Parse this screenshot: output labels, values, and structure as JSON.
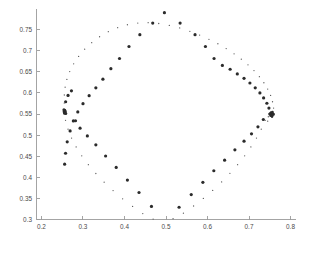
{
  "chart_data": {
    "type": "scatter",
    "title": "",
    "subtitle": "",
    "xlabel": "",
    "ylabel": "",
    "xlim": [
      0.188,
      0.812
    ],
    "ylim": [
      0.3,
      0.8
    ],
    "xticks": [
      0.2,
      0.3,
      0.4,
      0.5,
      0.6,
      0.7,
      0.8
    ],
    "xtick_labels": [
      "0.2",
      "0.3",
      "0.4",
      "0.5",
      "0.6",
      "0.7",
      "0.8"
    ],
    "yticks": [
      0.3,
      0.35,
      0.4,
      0.45,
      0.5,
      0.55,
      0.6,
      0.65,
      0.7,
      0.75
    ],
    "ytick_labels": [
      "0.3",
      "0.35",
      "0.4",
      "0.45",
      "0.5",
      "0.55",
      "0.6",
      "0.65",
      "0.7",
      "0.75"
    ],
    "grid": false,
    "legend": "none",
    "axis_color": "#9a9a9a",
    "marker_colors": {
      "inner": "#2b2b2b",
      "outer": "#5a5a5a"
    },
    "series": [
      {
        "name": "inner-curve",
        "marker": "large-dot",
        "marker_size": 3.2,
        "color": "#2b2b2b",
        "points": [
          [
            0.7502,
            0.55
          ],
          [
            0.748,
            0.564
          ],
          [
            0.743,
            0.5755
          ],
          [
            0.7352,
            0.588
          ],
          [
            0.7262,
            0.6
          ],
          [
            0.715,
            0.612
          ],
          [
            0.7022,
            0.6235
          ],
          [
            0.688,
            0.6345
          ],
          [
            0.6718,
            0.645
          ],
          [
            0.6545,
            0.656
          ],
          [
            0.6358,
            0.665
          ],
          [
            0.6158,
            0.6815
          ],
          [
            0.595,
            0.71
          ],
          [
            0.57,
            0.738
          ],
          [
            0.534,
            0.7655
          ],
          [
            0.4962,
            0.79
          ],
          [
            0.468,
            0.7655
          ],
          [
            0.437,
            0.738
          ],
          [
            0.4108,
            0.71
          ],
          [
            0.388,
            0.6815
          ],
          [
            0.3672,
            0.6575
          ],
          [
            0.348,
            0.6325
          ],
          [
            0.331,
            0.612
          ],
          [
            0.3148,
            0.5935
          ],
          [
            0.3,
            0.5745
          ],
          [
            0.2875,
            0.555
          ],
          [
            0.2768,
            0.5335
          ],
          [
            0.269,
            0.51
          ],
          [
            0.262,
            0.484
          ],
          [
            0.258,
            0.457
          ],
          [
            0.2558,
            0.431
          ],
          [
            0.2555,
            0.555
          ],
          [
            0.2582,
            0.579
          ],
          [
            0.264,
            0.594
          ],
          [
            0.2722,
            0.605
          ],
          [
            0.282,
            0.534
          ],
          [
            0.293,
            0.5165
          ],
          [
            0.3105,
            0.498
          ],
          [
            0.331,
            0.477
          ],
          [
            0.3545,
            0.4505
          ],
          [
            0.38,
            0.4235
          ],
          [
            0.407,
            0.3935
          ],
          [
            0.435,
            0.364
          ],
          [
            0.465,
            0.331
          ],
          [
            0.5315,
            0.329
          ],
          [
            0.5608,
            0.359
          ],
          [
            0.5888,
            0.388
          ],
          [
            0.6152,
            0.4155
          ],
          [
            0.6412,
            0.4405
          ],
          [
            0.666,
            0.465
          ],
          [
            0.688,
            0.4855
          ],
          [
            0.706,
            0.503
          ],
          [
            0.7215,
            0.5195
          ],
          [
            0.7345,
            0.537
          ]
        ]
      },
      {
        "name": "outer-curve",
        "marker": "small-dot",
        "marker_size": 1.3,
        "color": "#5a5a5a",
        "points": [
          [
            0.76,
            0.5505
          ],
          [
            0.7592,
            0.564
          ],
          [
            0.7566,
            0.579
          ],
          [
            0.752,
            0.594
          ],
          [
            0.745,
            0.609
          ],
          [
            0.7358,
            0.624
          ],
          [
            0.725,
            0.6385
          ],
          [
            0.712,
            0.653
          ],
          [
            0.6975,
            0.6665
          ],
          [
            0.6815,
            0.68
          ],
          [
            0.664,
            0.6925
          ],
          [
            0.645,
            0.705
          ],
          [
            0.625,
            0.7165
          ],
          [
            0.6035,
            0.727
          ],
          [
            0.581,
            0.737
          ],
          [
            0.5575,
            0.746
          ],
          [
            0.533,
            0.754
          ],
          [
            0.508,
            0.76
          ],
          [
            0.4825,
            0.7645
          ],
          [
            0.457,
            0.7665
          ],
          [
            0.432,
            0.7655
          ],
          [
            0.407,
            0.7615
          ],
          [
            0.3835,
            0.7545
          ],
          [
            0.361,
            0.745
          ],
          [
            0.34,
            0.733
          ],
          [
            0.321,
            0.719
          ],
          [
            0.304,
            0.7035
          ],
          [
            0.2895,
            0.6865
          ],
          [
            0.2775,
            0.669
          ],
          [
            0.268,
            0.6505
          ],
          [
            0.2612,
            0.632
          ],
          [
            0.257,
            0.6135
          ],
          [
            0.255,
            0.595
          ],
          [
            0.2548,
            0.576
          ],
          [
            0.2552,
            0.556
          ],
          [
            0.258,
            0.535
          ],
          [
            0.264,
            0.514
          ],
          [
            0.2725,
            0.493
          ],
          [
            0.2835,
            0.472
          ],
          [
            0.297,
            0.451
          ],
          [
            0.313,
            0.43
          ],
          [
            0.331,
            0.409
          ],
          [
            0.351,
            0.3885
          ],
          [
            0.3725,
            0.3685
          ],
          [
            0.3955,
            0.349
          ],
          [
            0.4195,
            0.331
          ],
          [
            0.444,
            0.314
          ],
          [
            0.469,
            0.301
          ],
          [
            0.517,
            0.302
          ],
          [
            0.542,
            0.315
          ],
          [
            0.5665,
            0.332
          ],
          [
            0.59,
            0.35
          ],
          [
            0.6125,
            0.369
          ],
          [
            0.634,
            0.389
          ],
          [
            0.654,
            0.4095
          ],
          [
            0.6725,
            0.43
          ],
          [
            0.6895,
            0.451
          ],
          [
            0.7045,
            0.472
          ],
          [
            0.718,
            0.493
          ],
          [
            0.7295,
            0.514
          ],
          [
            0.739,
            0.535
          ],
          [
            0.7465,
            0.5435
          ],
          [
            0.7535,
            0.547
          ],
          [
            0.7555,
            0.542
          ],
          [
            0.745,
            0.533
          ]
        ]
      },
      {
        "name": "left-cusp-cluster",
        "marker": "large-dot",
        "marker_size": 3.0,
        "color": "#2b2b2b",
        "points": [
          [
            0.2545,
            0.5555
          ],
          [
            0.2555,
            0.552
          ],
          [
            0.2562,
            0.559
          ],
          [
            0.2575,
            0.5555
          ],
          [
            0.254,
            0.56
          ],
          [
            0.2585,
            0.551
          ]
        ]
      },
      {
        "name": "right-cusp-cluster",
        "marker": "large-dot",
        "marker_size": 2.6,
        "color": "#2b2b2b",
        "points": [
          [
            0.7545,
            0.55
          ],
          [
            0.756,
            0.547
          ],
          [
            0.7575,
            0.551
          ],
          [
            0.753,
            0.5535
          ],
          [
            0.752,
            0.546
          ],
          [
            0.759,
            0.549
          ],
          [
            0.7505,
            0.5505
          ],
          [
            0.7555,
            0.544
          ],
          [
            0.7565,
            0.5545
          ]
        ]
      }
    ]
  }
}
